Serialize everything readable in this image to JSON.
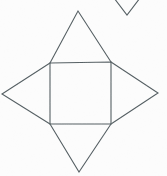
{
  "figure": {
    "background_color": "#fcfcfc",
    "stroke_color": "#555f63",
    "canvas": {
      "width": 167,
      "height": 176
    },
    "shapes": [
      {
        "name": "central-square",
        "kind": "square",
        "points": "50,63 111,62 111,124 50,124",
        "closed": true
      },
      {
        "name": "top-triangle-flap",
        "kind": "triangle",
        "points": "50,63 78,11 111,62",
        "closed": false
      },
      {
        "name": "bottom-triangle-flap",
        "kind": "triangle",
        "points": "50,124 79,172 111,124",
        "closed": false
      },
      {
        "name": "left-triangle-flap",
        "kind": "triangle",
        "points": "50,63 2,94 50,124",
        "closed": false
      },
      {
        "name": "right-triangle-flap",
        "kind": "triangle",
        "points": "111,62 158,93 111,124",
        "closed": false
      },
      {
        "name": "partial-triangle-top-right",
        "kind": "chevron",
        "points": "114,-2 127,15 140,-2",
        "closed": false
      }
    ]
  }
}
